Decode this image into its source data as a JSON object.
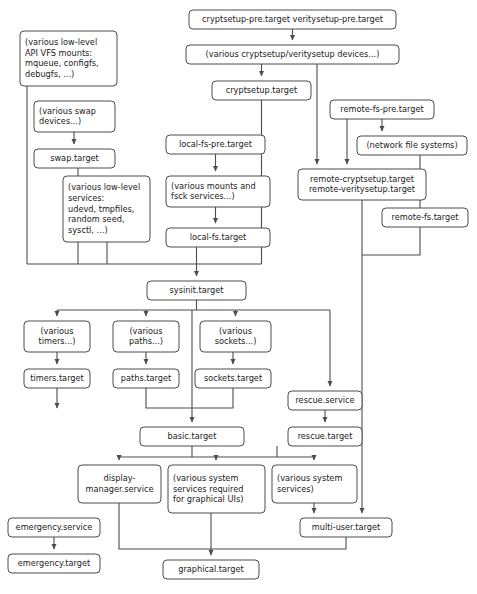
{
  "diagram": {
    "type": "flowchart",
    "background_color": "#ffffff",
    "box_stroke_color": "#4d4d4d",
    "edge_color": "#4d4d4d",
    "text_color": "#1a1a1a",
    "nodes": [
      {
        "id": "cryptsetup-pre",
        "label": "cryptsetup-pre.target veritysetup-pre.target",
        "lines": [
          "cryptsetup-pre.target veritysetup-pre.target"
        ],
        "x": 189,
        "y": 10,
        "w": 207,
        "h": 19,
        "rounded": true
      },
      {
        "id": "various-cryptsetup-devices",
        "label": "(various cryptsetup/veritysetup devices...)",
        "lines": [
          "(various cryptsetup/veritysetup devices...)"
        ],
        "x": 186,
        "y": 45,
        "w": 213,
        "h": 19,
        "rounded": true
      },
      {
        "id": "cryptsetup-target",
        "label": "cryptsetup.target",
        "lines": [
          "cryptsetup.target"
        ],
        "x": 212,
        "y": 81,
        "w": 99,
        "h": 19,
        "rounded": true
      },
      {
        "id": "various-vfs-mounts",
        "label": "(various low-level API VFS mounts: mqueue, configfs, debugfs, ...)",
        "lines": [
          "(various low-level",
          "API VFS mounts:",
          "mqueue, configfs,",
          "debugfs, ...)"
        ],
        "x": 20,
        "y": 31,
        "w": 97,
        "h": 55,
        "rounded": true,
        "align": "left"
      },
      {
        "id": "various-swap-devices",
        "label": "(various swap devices...)",
        "lines": [
          "(various swap",
          "devices...)"
        ],
        "x": 34,
        "y": 101,
        "w": 81,
        "h": 31,
        "rounded": true,
        "align": "left"
      },
      {
        "id": "swap-target",
        "label": "swap.target",
        "lines": [
          "swap.target"
        ],
        "x": 34,
        "y": 149,
        "w": 81,
        "h": 19,
        "rounded": true
      },
      {
        "id": "various-low-level-services",
        "label": "(various low-level services: udevd, tmpfiles, random seed, sysctl, ...)",
        "lines": [
          "(various low-level",
          "services:",
          "udevd, tmpfiles,",
          "random seed,",
          "sysctl, ...)"
        ],
        "x": 63,
        "y": 176,
        "w": 87,
        "h": 66,
        "rounded": true,
        "align": "left"
      },
      {
        "id": "local-fs-pre",
        "label": "local-fs-pre.target",
        "lines": [
          "local-fs-pre.target"
        ],
        "x": 166,
        "y": 135,
        "w": 99,
        "h": 19,
        "rounded": true
      },
      {
        "id": "various-mounts-fsck",
        "label": "(various mounts and fsck services...)",
        "lines": [
          "(various mounts and",
          "fsck services...)"
        ],
        "x": 166,
        "y": 176,
        "w": 104,
        "h": 31,
        "rounded": true,
        "align": "left"
      },
      {
        "id": "local-fs-target",
        "label": "local-fs.target",
        "lines": [
          "local-fs.target"
        ],
        "x": 166,
        "y": 228,
        "w": 104,
        "h": 19,
        "rounded": true
      },
      {
        "id": "remote-fs-pre",
        "label": "remote-fs-pre.target",
        "lines": [
          "remote-fs-pre.target"
        ],
        "x": 330,
        "y": 100,
        "w": 104,
        "h": 19,
        "rounded": true
      },
      {
        "id": "network-file-systems",
        "label": "(network file systems)",
        "lines": [
          "(network file systems)"
        ],
        "x": 357,
        "y": 136,
        "w": 110,
        "h": 19,
        "rounded": true
      },
      {
        "id": "remote-cryptsetup",
        "label": "remote-cryptsetup.target remote-veritysetup.target",
        "lines": [
          "remote-cryptsetup.target",
          "remote-veritysetup.target"
        ],
        "x": 298,
        "y": 169,
        "w": 128,
        "h": 31,
        "rounded": true
      },
      {
        "id": "remote-fs-target",
        "label": "remote-fs.target",
        "lines": [
          "remote-fs.target"
        ],
        "x": 382,
        "y": 208,
        "w": 86,
        "h": 19,
        "rounded": true
      },
      {
        "id": "sysinit-target",
        "label": "sysinit.target",
        "lines": [
          "sysinit.target"
        ],
        "x": 147,
        "y": 281,
        "w": 99,
        "h": 19,
        "rounded": true
      },
      {
        "id": "various-timers",
        "label": "(various timers...)",
        "lines": [
          "(various",
          "timers...)"
        ],
        "x": 24,
        "y": 321,
        "w": 66,
        "h": 31,
        "rounded": true
      },
      {
        "id": "various-paths",
        "label": "(various paths...)",
        "lines": [
          "(various",
          "paths...)"
        ],
        "x": 113,
        "y": 321,
        "w": 66,
        "h": 31,
        "rounded": true
      },
      {
        "id": "various-sockets",
        "label": "(various sockets...)",
        "lines": [
          "(various",
          "sockets...)"
        ],
        "x": 200,
        "y": 321,
        "w": 71,
        "h": 31,
        "rounded": true
      },
      {
        "id": "timers-target",
        "label": "timers.target",
        "lines": [
          "timers.target"
        ],
        "x": 24,
        "y": 369,
        "w": 66,
        "h": 19,
        "rounded": true
      },
      {
        "id": "paths-target",
        "label": "paths.target",
        "lines": [
          "paths.target"
        ],
        "x": 113,
        "y": 369,
        "w": 66,
        "h": 19,
        "rounded": true
      },
      {
        "id": "sockets-target",
        "label": "sockets.target",
        "lines": [
          "sockets.target"
        ],
        "x": 195,
        "y": 369,
        "w": 76,
        "h": 19,
        "rounded": true
      },
      {
        "id": "rescue-service",
        "label": "rescue.service",
        "lines": [
          "rescue.service"
        ],
        "x": 288,
        "y": 391,
        "w": 74,
        "h": 19,
        "rounded": true
      },
      {
        "id": "rescue-target",
        "label": "rescue.target",
        "lines": [
          "rescue.target"
        ],
        "x": 288,
        "y": 427,
        "w": 74,
        "h": 19,
        "rounded": true
      },
      {
        "id": "basic-target",
        "label": "basic.target",
        "lines": [
          "basic.target"
        ],
        "x": 140,
        "y": 427,
        "w": 104,
        "h": 19,
        "rounded": true
      },
      {
        "id": "display-manager-service",
        "label": "display-manager.service",
        "lines": [
          "display-",
          "manager.service"
        ],
        "x": 78,
        "y": 465,
        "w": 83,
        "h": 38,
        "rounded": true
      },
      {
        "id": "various-graphical-services",
        "label": "(various system services required for graphical UIs)",
        "lines": [
          "(various system",
          "services required",
          "for graphical UIs)"
        ],
        "x": 168,
        "y": 465,
        "w": 97,
        "h": 48,
        "rounded": true,
        "align": "left"
      },
      {
        "id": "various-system-services",
        "label": "(various system services)",
        "lines": [
          "(various system",
          "services)"
        ],
        "x": 272,
        "y": 465,
        "w": 85,
        "h": 38,
        "rounded": true,
        "align": "left"
      },
      {
        "id": "emergency-service",
        "label": "emergency.service",
        "lines": [
          "emergency.service"
        ],
        "x": 8,
        "y": 518,
        "w": 92,
        "h": 19,
        "rounded": true
      },
      {
        "id": "emergency-target",
        "label": "emergency.target",
        "lines": [
          "emergency.target"
        ],
        "x": 8,
        "y": 554,
        "w": 92,
        "h": 19,
        "rounded": true
      },
      {
        "id": "multi-user-target",
        "label": "multi-user.target",
        "lines": [
          "multi-user.target"
        ],
        "x": 300,
        "y": 518,
        "w": 92,
        "h": 19,
        "rounded": true
      },
      {
        "id": "graphical-target",
        "label": "graphical.target",
        "lines": [
          "graphical.target"
        ],
        "x": 163,
        "y": 560,
        "w": 96,
        "h": 19,
        "rounded": true
      }
    ],
    "edges": [
      {
        "from": "cryptsetup-pre",
        "to": "various-cryptsetup-devices"
      },
      {
        "from": "various-cryptsetup-devices",
        "to": "cryptsetup-target"
      },
      {
        "from": "various-cryptsetup-devices",
        "to": "remote-cryptsetup"
      },
      {
        "from": "remote-fs-pre",
        "to": "network-file-systems"
      },
      {
        "from": "remote-fs-pre",
        "to": "remote-cryptsetup"
      },
      {
        "from": "network-file-systems",
        "to": "remote-fs-target"
      },
      {
        "from": "local-fs-pre",
        "to": "various-mounts-fsck"
      },
      {
        "from": "various-mounts-fsck",
        "to": "local-fs-target"
      },
      {
        "from": "various-swap-devices",
        "to": "swap-target"
      },
      {
        "from": "various-vfs-mounts",
        "to": "sysinit-target"
      },
      {
        "from": "swap-target",
        "to": "sysinit-target"
      },
      {
        "from": "various-low-level-services",
        "to": "sysinit-target"
      },
      {
        "from": "local-fs-target",
        "to": "sysinit-target"
      },
      {
        "from": "cryptsetup-target",
        "to": "sysinit-target"
      },
      {
        "from": "sysinit-target",
        "to": "various-timers"
      },
      {
        "from": "sysinit-target",
        "to": "various-paths"
      },
      {
        "from": "sysinit-target",
        "to": "various-sockets"
      },
      {
        "from": "sysinit-target",
        "to": "rescue-service"
      },
      {
        "from": "sysinit-target",
        "to": "basic-target"
      },
      {
        "from": "various-timers",
        "to": "timers-target"
      },
      {
        "from": "various-paths",
        "to": "paths-target"
      },
      {
        "from": "various-sockets",
        "to": "sockets-target"
      },
      {
        "from": "paths-target",
        "to": "basic-target"
      },
      {
        "from": "sockets-target",
        "to": "basic-target"
      },
      {
        "from": "rescue-service",
        "to": "rescue-target"
      },
      {
        "from": "basic-target",
        "to": "display-manager-service"
      },
      {
        "from": "basic-target",
        "to": "various-graphical-services"
      },
      {
        "from": "basic-target",
        "to": "various-system-services"
      },
      {
        "from": "rescue-target",
        "to": "various-system-services"
      },
      {
        "from": "various-system-services",
        "to": "multi-user-target"
      },
      {
        "from": "remote-cryptsetup",
        "to": "multi-user-target"
      },
      {
        "from": "remote-fs-target",
        "to": "multi-user-target"
      },
      {
        "from": "display-manager-service",
        "to": "graphical-target"
      },
      {
        "from": "various-graphical-services",
        "to": "graphical-target"
      },
      {
        "from": "multi-user-target",
        "to": "graphical-target"
      },
      {
        "from": "emergency-service",
        "to": "emergency-target"
      }
    ]
  }
}
